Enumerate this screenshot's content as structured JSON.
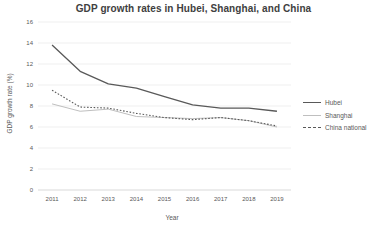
{
  "chart_data": {
    "type": "line",
    "title": "GDP growth rates in Hubei, Shanghai, and China",
    "xlabel": "Year",
    "ylabel": "GDP growth rate (%)",
    "ylim": [
      0,
      16
    ],
    "yticks": [
      0,
      2,
      4,
      6,
      8,
      10,
      12,
      14,
      16
    ],
    "grid": true,
    "legend_position": "right",
    "x": [
      "2011",
      "2012",
      "2013",
      "2014",
      "2015",
      "2016",
      "2017",
      "2018",
      "2019"
    ],
    "series": [
      {
        "name": "Hubei",
        "style": "solid",
        "color": "#595959",
        "width": 1.3,
        "values": [
          13.8,
          11.3,
          10.1,
          9.7,
          8.9,
          8.1,
          7.8,
          7.8,
          7.5
        ]
      },
      {
        "name": "Shanghai",
        "style": "solid",
        "color": "#bfbfbf",
        "width": 1.0,
        "values": [
          8.2,
          7.5,
          7.7,
          7.0,
          6.9,
          6.8,
          6.9,
          6.6,
          6.0
        ]
      },
      {
        "name": "China national",
        "style": "dotted",
        "color": "#595959",
        "width": 1.1,
        "values": [
          9.5,
          7.9,
          7.8,
          7.3,
          6.9,
          6.7,
          6.9,
          6.6,
          6.1
        ]
      }
    ]
  }
}
